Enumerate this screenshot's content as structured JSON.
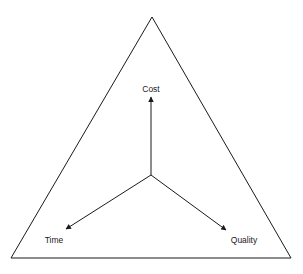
{
  "diagram": {
    "type": "triangle-with-vectors",
    "colors": {
      "stroke": "#1a1a1a",
      "background": "#ffffff"
    },
    "triangle": {
      "apex": [
        152,
        17
      ],
      "bottom_left": [
        11,
        258
      ],
      "bottom_right": [
        291,
        258
      ]
    },
    "center": [
      151,
      175
    ],
    "arrows": [
      {
        "name": "cost",
        "from": [
          151,
          175
        ],
        "to": [
          151,
          97
        ]
      },
      {
        "name": "time",
        "from": [
          151,
          175
        ],
        "to": [
          66,
          229
        ]
      },
      {
        "name": "quality",
        "from": [
          151,
          175
        ],
        "to": [
          226,
          230
        ]
      }
    ],
    "labels": {
      "cost": "Cost",
      "time": "Time",
      "quality": "Quality"
    }
  }
}
